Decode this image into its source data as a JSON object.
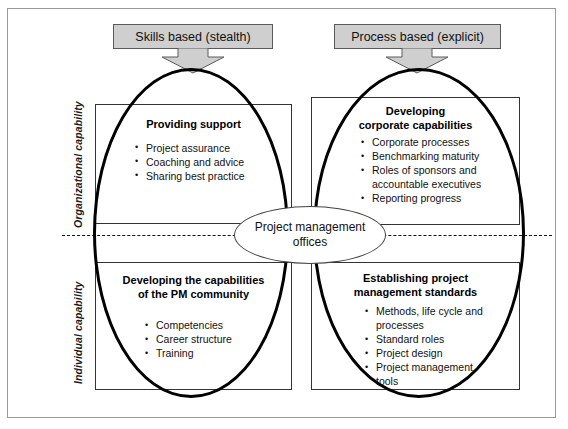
{
  "diagram": {
    "axes": {
      "top_label": "Organizational capability",
      "bottom_label": "Individual capability"
    },
    "headers": [
      {
        "id": "skills",
        "label": "Skills based (stealth)"
      },
      {
        "id": "process",
        "label": "Process based (explicit)"
      }
    ],
    "center": {
      "line1": "Project management",
      "line2": "offices"
    },
    "quadrants": {
      "top_left": {
        "title": "Providing support",
        "bullets": [
          {
            "text": "Project assurance",
            "bullet": true
          },
          {
            "text": "Coaching and advice",
            "bullet": true
          },
          {
            "text": "Sharing best practice",
            "bullet": true
          }
        ]
      },
      "top_right": {
        "title_line1": "Developing",
        "title_line2": "corporate capabilities",
        "bullets": [
          {
            "text": "Corporate processes",
            "bullet": true
          },
          {
            "text": "Benchmarking maturity",
            "bullet": true
          },
          {
            "text": "Roles of sponsors and",
            "bullet": true
          },
          {
            "text": "accountable executives",
            "bullet": false
          },
          {
            "text": "Reporting progress",
            "bullet": true
          }
        ]
      },
      "bottom_left": {
        "title_line1": "Developing the capabilities",
        "title_line2": "of the PM community",
        "bullets": [
          {
            "text": "Competencies",
            "bullet": true
          },
          {
            "text": "Career structure",
            "bullet": true
          },
          {
            "text": "Training",
            "bullet": true
          }
        ]
      },
      "bottom_right": {
        "title_line1": "Establishing  project",
        "title_line2": "management standards",
        "bullets": [
          {
            "text": "Methods, life cycle and",
            "bullet": true
          },
          {
            "text": "processes",
            "bullet": false
          },
          {
            "text": "Standard roles",
            "bullet": true
          },
          {
            "text": "Project design",
            "bullet": true
          },
          {
            "text": "Project management",
            "bullet": true
          },
          {
            "text": "tools",
            "bullet": false
          }
        ]
      }
    },
    "colors": {
      "header_fill": "#cfcfcf",
      "header_stroke": "#5a5a5a",
      "ellipse_stroke": "#000000",
      "box_stroke": "#333333",
      "frame_stroke": "#9a9a9a",
      "text": "#111111"
    }
  }
}
